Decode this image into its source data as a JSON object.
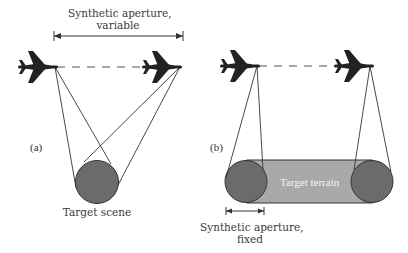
{
  "figure": {
    "panel_a": {
      "label": "(a)",
      "aperture_label_line1": "Synthetic aperture,",
      "aperture_label_line2": "variable",
      "target_label": "Target scene"
    },
    "panel_b": {
      "label": "(b)",
      "terrain_label": "Target terrain",
      "aperture_label_line1": "Synthetic aperture,",
      "aperture_label_line2": "fixed"
    },
    "colors": {
      "ink": "#222222",
      "target_fill": "#6b6b6b",
      "terrain_fill": "#a9a9a9",
      "line": "#333333"
    }
  }
}
